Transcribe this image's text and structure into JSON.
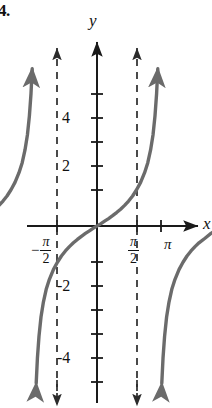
{
  "figure": {
    "problem_number": "4.",
    "width": 212,
    "height": 408,
    "background_color": "#ffffff",
    "curve_color": "#6b6b6b",
    "axis_color": "#1a1a1a",
    "asymptote_color": "#2b2b2b"
  },
  "axes": {
    "x_label": "x",
    "y_label": "y",
    "origin_px": [
      97,
      226
    ],
    "x_unit_px": 40,
    "y_unit_px": 24,
    "x_ticks": [
      {
        "label": "-π/2",
        "value": -1.5708,
        "px": 57,
        "labeled": true
      },
      {
        "label": "",
        "value": 0,
        "px": 97,
        "labeled": false
      },
      {
        "label": "π/2",
        "value": 1.5708,
        "px": 137,
        "labeled": true
      },
      {
        "label": "π",
        "value": 3.1416,
        "px": 161,
        "labeled": true
      }
    ],
    "y_ticks": [
      {
        "label": "",
        "value": 5,
        "px": 94,
        "labeled": false
      },
      {
        "label": "4",
        "value": 4,
        "px": 118,
        "labeled": true
      },
      {
        "label": "",
        "value": 3,
        "px": 142,
        "labeled": false
      },
      {
        "label": "2",
        "value": 2,
        "px": 166,
        "labeled": true
      },
      {
        "label": "",
        "value": 1,
        "px": 190,
        "labeled": false
      },
      {
        "label": "",
        "value": -1,
        "px": 262,
        "labeled": false
      },
      {
        "label": "-2",
        "value": -2,
        "px": 286,
        "labeled": true
      },
      {
        "label": "",
        "value": -3,
        "px": 310,
        "labeled": false
      },
      {
        "label": "-4",
        "value": -4,
        "px": 334,
        "labeled": true
      },
      {
        "label": "",
        "value": -5,
        "px": 358,
        "labeled": false
      }
    ]
  },
  "chart_data": {
    "type": "line",
    "title": "",
    "subtitle": "",
    "xlabel": "x",
    "ylabel": "y",
    "function": "y = tan(x)",
    "grid": false,
    "legend": null,
    "xlim": [
      -2.6,
      4.0
    ],
    "ylim": [
      -7.3,
      7.3
    ],
    "x_tick_labels": [
      "-π/2",
      "π/2",
      "π"
    ],
    "x_tick_values": [
      -1.5708,
      1.5708,
      3.1416
    ],
    "y_tick_labels": [
      "4",
      "2",
      "-2",
      "-4"
    ],
    "y_tick_values": [
      4,
      2,
      -2,
      -4
    ],
    "asymptotes": [
      {
        "x": -1.5708,
        "label": "-π/2",
        "style": "dashed"
      },
      {
        "x": 1.5708,
        "label": "π/2",
        "style": "dashed"
      }
    ],
    "series": [
      {
        "name": "branch-left",
        "domain": [
          -2.85,
          -1.6
        ],
        "arrows": [
          "start",
          "end"
        ],
        "points": [
          [
            -2.85,
            0.31
          ],
          [
            -2.75,
            0.43
          ],
          [
            -2.65,
            0.56
          ],
          [
            -2.55,
            0.7
          ],
          [
            -2.45,
            0.86
          ],
          [
            -2.35,
            1.04
          ],
          [
            -2.25,
            1.25
          ],
          [
            -2.15,
            1.51
          ],
          [
            -2.05,
            1.82
          ],
          [
            -1.95,
            2.22
          ],
          [
            -1.87,
            2.64
          ],
          [
            -1.8,
            3.17
          ],
          [
            -1.74,
            3.79
          ],
          [
            -1.69,
            4.59
          ],
          [
            -1.65,
            5.52
          ],
          [
            -1.62,
            6.55
          ]
        ]
      },
      {
        "name": "branch-middle",
        "domain": [
          -1.52,
          1.52
        ],
        "arrows": [
          "start",
          "end"
        ],
        "points": [
          [
            -1.52,
            -6.55
          ],
          [
            -1.49,
            -5.52
          ],
          [
            -1.45,
            -4.59
          ],
          [
            -1.4,
            -3.79
          ],
          [
            -1.34,
            -3.17
          ],
          [
            -1.27,
            -2.64
          ],
          [
            -1.19,
            -2.22
          ],
          [
            -1.09,
            -1.82
          ],
          [
            -0.99,
            -1.51
          ],
          [
            -0.89,
            -1.25
          ],
          [
            -0.79,
            -1.04
          ],
          [
            -0.69,
            -0.86
          ],
          [
            -0.59,
            -0.7
          ],
          [
            -0.49,
            -0.56
          ],
          [
            -0.39,
            -0.43
          ],
          [
            -0.29,
            -0.31
          ],
          [
            -0.19,
            -0.2
          ],
          [
            -0.09,
            -0.09
          ],
          [
            0.0,
            0.0
          ],
          [
            0.09,
            0.09
          ],
          [
            0.19,
            0.2
          ],
          [
            0.29,
            0.31
          ],
          [
            0.39,
            0.43
          ],
          [
            0.49,
            0.56
          ],
          [
            0.59,
            0.7
          ],
          [
            0.69,
            0.86
          ],
          [
            0.79,
            1.04
          ],
          [
            0.89,
            1.25
          ],
          [
            0.99,
            1.51
          ],
          [
            1.09,
            1.82
          ],
          [
            1.19,
            2.22
          ],
          [
            1.27,
            2.64
          ],
          [
            1.34,
            3.17
          ],
          [
            1.4,
            3.79
          ],
          [
            1.45,
            4.59
          ],
          [
            1.49,
            5.52
          ],
          [
            1.52,
            6.55
          ]
        ]
      },
      {
        "name": "branch-right",
        "domain": [
          1.62,
          3.8
        ],
        "arrows": [
          "start",
          "end"
        ],
        "points": [
          [
            1.62,
            -6.55
          ],
          [
            1.65,
            -5.52
          ],
          [
            1.69,
            -4.59
          ],
          [
            1.74,
            -3.79
          ],
          [
            1.8,
            -3.17
          ],
          [
            1.87,
            -2.64
          ],
          [
            1.95,
            -2.22
          ],
          [
            2.05,
            -1.82
          ],
          [
            2.15,
            -1.51
          ],
          [
            2.25,
            -1.25
          ],
          [
            2.35,
            -1.04
          ],
          [
            2.45,
            -0.86
          ],
          [
            2.55,
            -0.7
          ],
          [
            2.7,
            -0.51
          ],
          [
            2.85,
            -0.31
          ],
          [
            3.0,
            -0.14
          ],
          [
            3.1416,
            0.0
          ],
          [
            3.3,
            0.16
          ],
          [
            3.5,
            0.37
          ],
          [
            3.7,
            0.6
          ],
          [
            3.85,
            0.8
          ]
        ]
      }
    ]
  }
}
